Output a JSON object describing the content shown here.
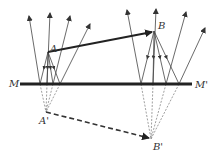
{
  "figure": {
    "colors": {
      "ink": "#222222",
      "ray": "#444444",
      "dashed": "#666666",
      "label": "#333333"
    },
    "labels": {
      "A": "A",
      "B": "B",
      "A_prime": "A'",
      "B_prime": "B'",
      "M": "M",
      "M_prime": "M'"
    },
    "mirror": {
      "x1": 20,
      "y1": 84,
      "x2": 192,
      "y2": 84
    },
    "points": {
      "A": [
        48,
        52
      ],
      "B": [
        154,
        31
      ],
      "A_prime": [
        46,
        112
      ],
      "B_prime": [
        151,
        139
      ]
    },
    "rays_A": {
      "hits": [
        [
          40,
          84
        ],
        [
          47,
          84
        ],
        [
          53,
          84
        ],
        [
          60,
          84
        ]
      ],
      "tips": [
        [
          29,
          16
        ],
        [
          50,
          13
        ],
        [
          70,
          16
        ],
        [
          90,
          24
        ]
      ]
    },
    "rays_B": {
      "hits": [
        [
          141,
          84
        ],
        [
          153,
          84
        ],
        [
          166,
          84
        ],
        [
          179,
          84
        ]
      ],
      "tips": [
        [
          127,
          10
        ],
        [
          156,
          9
        ],
        [
          186,
          12
        ],
        [
          205,
          28
        ]
      ]
    }
  }
}
